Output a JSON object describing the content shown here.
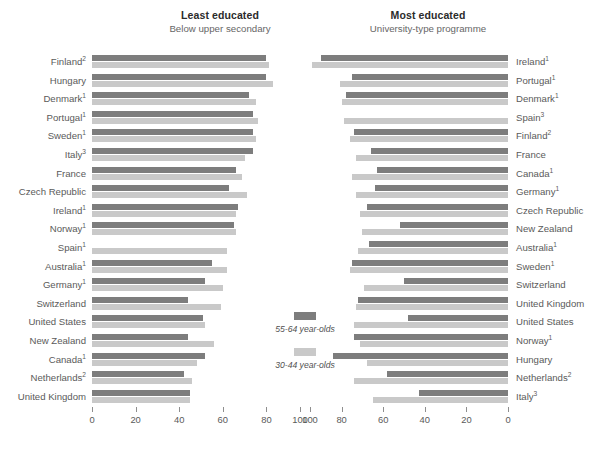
{
  "panels": {
    "left": {
      "title": "Least educated",
      "subtitle": "Below upper secondary"
    },
    "right": {
      "title": "Most educated",
      "subtitle": "University-type programme"
    }
  },
  "legend": {
    "items": [
      {
        "key": "older",
        "label": "55-64 year-olds",
        "color": "#7d7d7d"
      },
      {
        "key": "younger",
        "label": "30-44 year-olds",
        "color": "#c9c9c9"
      }
    ]
  },
  "axes": {
    "left": {
      "ticks": [
        "0",
        "20",
        "40",
        "60",
        "80",
        "100"
      ],
      "min": 0,
      "max": 100,
      "direction": "ltr"
    },
    "right": {
      "ticks": [
        "100",
        "80",
        "60",
        "40",
        "20",
        "0"
      ],
      "min": 0,
      "max": 100,
      "direction": "rtl"
    }
  },
  "chart_data": {
    "type": "bar",
    "orientation": "horizontal",
    "layout": "back-to-back paired panels, each panel sorted independently",
    "grid": false,
    "legend_position": "center",
    "series": [
      {
        "name": "55-64 year-olds",
        "color": "#7d7d7d"
      },
      {
        "name": "30-44 year-olds",
        "color": "#c9c9c9"
      }
    ],
    "panels": [
      {
        "name": "Least educated",
        "sublabel": "Below upper secondary",
        "xlabel": "",
        "ylabel": "",
        "xlim": [
          0,
          100
        ],
        "xticks": [
          0,
          20,
          40,
          60,
          80,
          100
        ],
        "categories": [
          "Finland²",
          "Hungary",
          "Denmark¹",
          "Portugal¹",
          "Sweden¹",
          "Italy³",
          "France",
          "Czech Republic",
          "Ireland¹",
          "Norway¹",
          "Spain¹",
          "Australia¹",
          "Germany¹",
          "Switzerland",
          "United States",
          "New Zealand",
          "Canada¹",
          "Netherlands²",
          "United Kingdom"
        ],
        "values_55_64": [
          80,
          80,
          72,
          74,
          74,
          74,
          66,
          63,
          67,
          65,
          0,
          55,
          52,
          44,
          51,
          44,
          52,
          42,
          45
        ],
        "values_30_44": [
          81,
          83,
          75,
          76,
          75,
          70,
          69,
          71,
          66,
          66,
          62,
          62,
          60,
          59,
          52,
          56,
          48,
          46,
          45
        ]
      },
      {
        "name": "Most educated",
        "sublabel": "University-type programme",
        "xlabel": "",
        "ylabel": "",
        "xlim": [
          0,
          100
        ],
        "xticks": [
          100,
          80,
          60,
          40,
          20,
          0
        ],
        "categories": [
          "Ireland¹",
          "Portugal¹",
          "Denmark¹",
          "Spain³",
          "Finland²",
          "France",
          "Canada¹",
          "Germany¹",
          "Czech Republic",
          "New Zealand",
          "Australia¹",
          "Sweden¹",
          "Switzerland",
          "United Kingdom",
          "United States",
          "Norway¹",
          "Hungary",
          "Netherlands²",
          "Italy³"
        ],
        "values_55_64": [
          90,
          75,
          78,
          0,
          74,
          66,
          63,
          64,
          68,
          52,
          67,
          75,
          50,
          72,
          48,
          74,
          84,
          58,
          43
        ],
        "values_30_44": [
          94,
          81,
          80,
          79,
          76,
          73,
          75,
          73,
          71,
          70,
          72,
          76,
          69,
          73,
          74,
          71,
          68,
          74,
          65
        ]
      }
    ]
  }
}
